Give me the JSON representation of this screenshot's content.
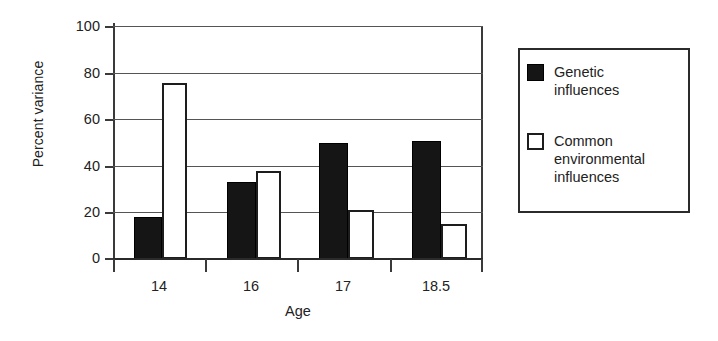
{
  "chart_data": {
    "type": "bar",
    "title": "",
    "xlabel": "Age",
    "ylabel": "Percent variance",
    "categories": [
      "14",
      "16",
      "17",
      "18.5"
    ],
    "series": [
      {
        "name": "Genetic influences",
        "color": "#151515",
        "fill": "solid-black",
        "values": [
          18,
          33,
          50,
          51
        ]
      },
      {
        "name": "Common environmental influences",
        "color": "#ffffff",
        "fill": "white-outlined",
        "values": [
          76,
          38,
          21,
          15
        ]
      }
    ],
    "ylim": [
      0,
      100
    ],
    "yticks": [
      0,
      20,
      40,
      60,
      80,
      100
    ],
    "ytick_labels": [
      "0",
      "20",
      "40",
      "60",
      "80",
      "100"
    ],
    "grid": "horizontal",
    "legend_position": "right-outside",
    "legend_entries": [
      {
        "label_line1": "Genetic",
        "label_line2": "influences",
        "swatch": "filled"
      },
      {
        "label_line1": "Common",
        "label_line2": "environmental",
        "label_line3": "influences",
        "swatch": "hollow"
      }
    ]
  },
  "axes": {
    "y_title": "Percent variance",
    "x_title": "Age",
    "y_ticks": [
      "100",
      "80",
      "60",
      "40",
      "20",
      "0"
    ],
    "x_ticks": [
      "14",
      "16",
      "17",
      "18.5"
    ]
  },
  "legend": {
    "genetic_label": "Genetic\ninfluences",
    "genetic_line1": "Genetic",
    "genetic_line2": "influences",
    "common_line1": "Common",
    "common_line2": "environmental",
    "common_line3": "influences"
  }
}
